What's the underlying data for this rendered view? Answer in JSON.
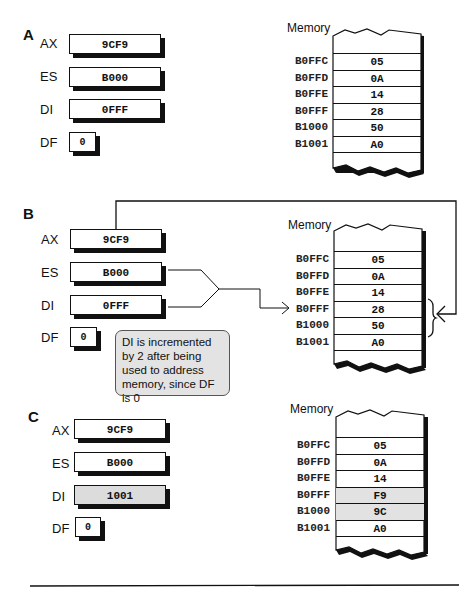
{
  "panels": [
    {
      "letter": "A",
      "registers": {
        "AX": "9CF9",
        "ES": "B000",
        "DI": "0FFF",
        "DF": "0"
      },
      "register_labels": {
        "AX": "AX",
        "ES": "ES",
        "DI": "DI",
        "DF": "DF"
      },
      "memory_title": "Memory",
      "memory": [
        {
          "addr": "B0FFC",
          "value": "05"
        },
        {
          "addr": "B0FFD",
          "value": "0A"
        },
        {
          "addr": "B0FFE",
          "value": "14"
        },
        {
          "addr": "B0FFF",
          "value": "28"
        },
        {
          "addr": "B1000",
          "value": "50"
        },
        {
          "addr": "B1001",
          "value": "A0"
        }
      ]
    },
    {
      "letter": "B",
      "registers": {
        "AX": "9CF9",
        "ES": "B000",
        "DI": "0FFF",
        "DF": "0"
      },
      "register_labels": {
        "AX": "AX",
        "ES": "ES",
        "DI": "DI",
        "DF": "DF"
      },
      "memory_title": "Memory",
      "memory": [
        {
          "addr": "B0FFC",
          "value": "05"
        },
        {
          "addr": "B0FFD",
          "value": "0A"
        },
        {
          "addr": "B0FFE",
          "value": "14"
        },
        {
          "addr": "B0FFF",
          "value": "28"
        },
        {
          "addr": "B1000",
          "value": "50"
        },
        {
          "addr": "B1001",
          "value": "A0"
        }
      ],
      "callout": "DI is incremented by 2 after being used to address memory, since DF is 0"
    },
    {
      "letter": "C",
      "registers": {
        "AX": "9CF9",
        "ES": "B000",
        "DI": "1001",
        "DF": "0"
      },
      "register_labels": {
        "AX": "AX",
        "ES": "ES",
        "DI": "DI",
        "DF": "DF"
      },
      "memory_title": "Memory",
      "memory": [
        {
          "addr": "B0FFC",
          "value": "05"
        },
        {
          "addr": "B0FFD",
          "value": "0A"
        },
        {
          "addr": "B0FFE",
          "value": "14"
        },
        {
          "addr": "B0FFF",
          "value": "F9"
        },
        {
          "addr": "B1000",
          "value": "9C"
        },
        {
          "addr": "B1001",
          "value": "A0"
        }
      ]
    }
  ],
  "colors": {
    "ink": "#111111",
    "highlight": "#dcdcdc",
    "callout_bg": "#e3e3e3"
  }
}
